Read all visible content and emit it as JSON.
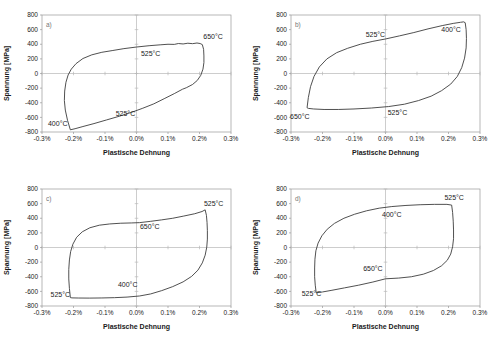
{
  "figure": {
    "background": "#ffffff",
    "frame_color": "#999999",
    "axis_color": "#b8b8b8",
    "curve_color": "#3c3c3c",
    "text_color": "#1a1a1a"
  },
  "chart_data": [
    {
      "type": "line",
      "panel_label": "a)",
      "xlabel": "Plastische Dehnung",
      "ylabel": "Spannung [MPa]",
      "xlim": [
        -0.3,
        0.3
      ],
      "ylim": [
        -800,
        800
      ],
      "x_tick_values": [
        -0.3,
        -0.2,
        -0.1,
        0.0,
        0.1,
        0.2,
        0.3
      ],
      "x_tick_labels": [
        "-0.3%",
        "-0.2%",
        "-0.1%",
        "0.0%",
        "0.1%",
        "0.2%",
        "0.3%"
      ],
      "y_tick_values": [
        800,
        600,
        400,
        200,
        0,
        -200,
        -400,
        -600,
        -800
      ],
      "y_tick_labels": [
        "800",
        "600",
        "400",
        "200",
        "0",
        "-200",
        "-400",
        "-600",
        "-800"
      ],
      "grid": false,
      "legend": "none",
      "annotations": [
        {
          "text": "650°C",
          "x": 0.243,
          "y": 500
        },
        {
          "text": "525°C",
          "x": 0.045,
          "y": 270
        },
        {
          "text": "525°C",
          "x": -0.035,
          "y": -545
        },
        {
          "text": "400°C",
          "x": -0.25,
          "y": -680
        }
      ],
      "series": [
        {
          "name": "Hystereseschleife",
          "points": [
            [
              -0.21,
              -770
            ],
            [
              -0.219,
              -640
            ],
            [
              -0.226,
              -500
            ],
            [
              -0.229,
              -370
            ],
            [
              -0.228,
              -240
            ],
            [
              -0.224,
              -120
            ],
            [
              -0.217,
              -20
            ],
            [
              -0.207,
              60
            ],
            [
              -0.192,
              135
            ],
            [
              -0.17,
              205
            ],
            [
              -0.142,
              255
            ],
            [
              -0.11,
              290
            ],
            [
              -0.075,
              315
            ],
            [
              -0.04,
              340
            ],
            [
              0.0,
              362
            ],
            [
              0.04,
              380
            ],
            [
              0.075,
              392
            ],
            [
              0.1,
              400
            ],
            [
              0.12,
              398
            ],
            [
              0.133,
              410
            ],
            [
              0.148,
              404
            ],
            [
              0.163,
              414
            ],
            [
              0.178,
              408
            ],
            [
              0.192,
              417
            ],
            [
              0.202,
              410
            ],
            [
              0.209,
              395
            ],
            [
              0.213,
              330
            ],
            [
              0.214,
              240
            ],
            [
              0.214,
              150
            ],
            [
              0.211,
              60
            ],
            [
              0.204,
              -25
            ],
            [
              0.193,
              -95
            ],
            [
              0.178,
              -150
            ],
            [
              0.158,
              -195
            ],
            [
              0.146,
              -215
            ],
            [
              0.12,
              -275
            ],
            [
              0.09,
              -340
            ],
            [
              0.055,
              -415
            ],
            [
              0.02,
              -475
            ],
            [
              -0.015,
              -530
            ],
            [
              -0.055,
              -585
            ],
            [
              -0.095,
              -635
            ],
            [
              -0.135,
              -685
            ],
            [
              -0.17,
              -725
            ],
            [
              -0.195,
              -755
            ]
          ]
        }
      ]
    },
    {
      "type": "line",
      "panel_label": "b)",
      "xlabel": "Plastische Dehnung",
      "ylabel": "Spannung [MPa]",
      "xlim": [
        -0.3,
        0.3
      ],
      "ylim": [
        -800,
        800
      ],
      "x_tick_values": [
        -0.3,
        -0.2,
        -0.1,
        0.0,
        0.1,
        0.2,
        0.3
      ],
      "x_tick_labels": [
        "-0.3%",
        "-0.2%",
        "-0.1%",
        "0.0%",
        "0.1%",
        "0.2%",
        "0.3%"
      ],
      "y_tick_values": [
        800,
        600,
        400,
        200,
        0,
        -200,
        -400,
        -600,
        -800
      ],
      "y_tick_labels": [
        "800",
        "600",
        "400",
        "200",
        "0",
        "-200",
        "-400",
        "-600",
        "-800"
      ],
      "grid": false,
      "legend": "none",
      "annotations": [
        {
          "text": "525°C",
          "x": -0.032,
          "y": 530
        },
        {
          "text": "400°C",
          "x": 0.208,
          "y": 600
        },
        {
          "text": "650°C",
          "x": -0.272,
          "y": -590
        },
        {
          "text": "525°C",
          "x": 0.038,
          "y": -530
        }
      ],
      "series": [
        {
          "name": "Hystereseschleife",
          "points": [
            [
              -0.249,
              -468
            ],
            [
              -0.245,
              -330
            ],
            [
              -0.238,
              -180
            ],
            [
              -0.227,
              -40
            ],
            [
              -0.21,
              90
            ],
            [
              -0.186,
              200
            ],
            [
              -0.155,
              285
            ],
            [
              -0.12,
              345
            ],
            [
              -0.08,
              400
            ],
            [
              -0.04,
              440
            ],
            [
              0.0,
              472
            ],
            [
              0.045,
              515
            ],
            [
              0.09,
              560
            ],
            [
              0.135,
              610
            ],
            [
              0.18,
              655
            ],
            [
              0.215,
              685
            ],
            [
              0.238,
              700
            ],
            [
              0.248,
              706
            ],
            [
              0.253,
              695
            ],
            [
              0.256,
              600
            ],
            [
              0.257,
              480
            ],
            [
              0.256,
              350
            ],
            [
              0.251,
              210
            ],
            [
              0.242,
              80
            ],
            [
              0.228,
              -40
            ],
            [
              0.207,
              -145
            ],
            [
              0.178,
              -235
            ],
            [
              0.145,
              -310
            ],
            [
              0.105,
              -370
            ],
            [
              0.06,
              -420
            ],
            [
              0.01,
              -452
            ],
            [
              -0.045,
              -472
            ],
            [
              -0.1,
              -485
            ],
            [
              -0.15,
              -492
            ],
            [
              -0.195,
              -492
            ],
            [
              -0.228,
              -485
            ],
            [
              -0.245,
              -477
            ]
          ]
        }
      ]
    },
    {
      "type": "line",
      "panel_label": "c)",
      "xlabel": "Plastische Dehnung",
      "ylabel": "Spannung [MPa]",
      "xlim": [
        -0.3,
        0.3
      ],
      "ylim": [
        -800,
        800
      ],
      "x_tick_values": [
        -0.3,
        -0.2,
        -0.1,
        0.0,
        0.1,
        0.2,
        0.3
      ],
      "x_tick_labels": [
        "-0.3%",
        "-0.2%",
        "-0.1%",
        "0.0%",
        "0.1%",
        "0.2%",
        "0.3%"
      ],
      "y_tick_values": [
        800,
        600,
        400,
        200,
        0,
        -200,
        -400,
        -600,
        -800
      ],
      "y_tick_labels": [
        "800",
        "600",
        "400",
        "200",
        "0",
        "-200",
        "-400",
        "-600",
        "-800"
      ],
      "grid": false,
      "legend": "none",
      "annotations": [
        {
          "text": "525°C",
          "x": 0.245,
          "y": 600
        },
        {
          "text": "650°C",
          "x": 0.042,
          "y": 290
        },
        {
          "text": "400°C",
          "x": -0.028,
          "y": -510
        },
        {
          "text": "525°C",
          "x": -0.242,
          "y": -648
        }
      ],
      "series": [
        {
          "name": "Hystereseschleife",
          "points": [
            [
              -0.21,
              -685
            ],
            [
              -0.213,
              -560
            ],
            [
              -0.215,
              -430
            ],
            [
              -0.215,
              -300
            ],
            [
              -0.213,
              -170
            ],
            [
              -0.209,
              -55
            ],
            [
              -0.202,
              45
            ],
            [
              -0.19,
              140
            ],
            [
              -0.172,
              215
            ],
            [
              -0.148,
              270
            ],
            [
              -0.118,
              305
            ],
            [
              -0.085,
              322
            ],
            [
              -0.05,
              332
            ],
            [
              -0.015,
              336
            ],
            [
              0.01,
              340
            ],
            [
              0.045,
              358
            ],
            [
              0.08,
              378
            ],
            [
              0.115,
              400
            ],
            [
              0.15,
              430
            ],
            [
              0.185,
              462
            ],
            [
              0.208,
              492
            ],
            [
              0.218,
              515
            ],
            [
              0.222,
              440
            ],
            [
              0.224,
              340
            ],
            [
              0.225,
              230
            ],
            [
              0.225,
              115
            ],
            [
              0.223,
              5
            ],
            [
              0.218,
              -105
            ],
            [
              0.209,
              -210
            ],
            [
              0.195,
              -310
            ],
            [
              0.175,
              -395
            ],
            [
              0.148,
              -470
            ],
            [
              0.115,
              -535
            ],
            [
              0.08,
              -590
            ],
            [
              0.045,
              -635
            ],
            [
              0.01,
              -663
            ],
            [
              -0.03,
              -678
            ],
            [
              -0.07,
              -686
            ],
            [
              -0.11,
              -690
            ],
            [
              -0.15,
              -692
            ],
            [
              -0.185,
              -691
            ],
            [
              -0.205,
              -689
            ]
          ]
        }
      ]
    },
    {
      "type": "line",
      "panel_label": "d)",
      "xlabel": "Plastische Dehnung",
      "ylabel": "Spannung [MPa]",
      "xlim": [
        -0.3,
        0.3
      ],
      "ylim": [
        -800,
        800
      ],
      "x_tick_values": [
        -0.3,
        -0.2,
        -0.1,
        0.0,
        0.1,
        0.2,
        0.3
      ],
      "x_tick_labels": [
        "-0.3%",
        "-0.2%",
        "-0.1%",
        "0.0%",
        "0.1%",
        "0.2%",
        "0.3%"
      ],
      "y_tick_values": [
        800,
        600,
        400,
        200,
        0,
        -200,
        -400,
        -600,
        -800
      ],
      "y_tick_labels": [
        "800",
        "600",
        "400",
        "200",
        "0",
        "-200",
        "-400",
        "-600",
        "-800"
      ],
      "grid": false,
      "legend": "none",
      "annotations": [
        {
          "text": "525°C",
          "x": 0.218,
          "y": 680
        },
        {
          "text": "400°C",
          "x": 0.02,
          "y": 455
        },
        {
          "text": "650°C",
          "x": -0.04,
          "y": -290
        },
        {
          "text": "525°C",
          "x": -0.235,
          "y": -625
        }
      ],
      "series": [
        {
          "name": "Hystereseschleife",
          "points": [
            [
              -0.22,
              -620
            ],
            [
              -0.223,
              -515
            ],
            [
              -0.225,
              -400
            ],
            [
              -0.225,
              -280
            ],
            [
              -0.224,
              -160
            ],
            [
              -0.221,
              -45
            ],
            [
              -0.214,
              60
            ],
            [
              -0.202,
              160
            ],
            [
              -0.185,
              250
            ],
            [
              -0.162,
              330
            ],
            [
              -0.132,
              400
            ],
            [
              -0.098,
              455
            ],
            [
              -0.06,
              502
            ],
            [
              -0.02,
              538
            ],
            [
              0.02,
              560
            ],
            [
              0.065,
              575
            ],
            [
              0.11,
              585
            ],
            [
              0.155,
              590
            ],
            [
              0.195,
              590
            ],
            [
              0.21,
              580
            ],
            [
              0.213,
              480
            ],
            [
              0.215,
              360
            ],
            [
              0.216,
              240
            ],
            [
              0.216,
              120
            ],
            [
              0.213,
              10
            ],
            [
              0.207,
              -90
            ],
            [
              0.196,
              -175
            ],
            [
              0.178,
              -250
            ],
            [
              0.152,
              -315
            ],
            [
              0.12,
              -365
            ],
            [
              0.082,
              -400
            ],
            [
              0.042,
              -418
            ],
            [
              0.0,
              -428
            ],
            [
              -0.04,
              -472
            ],
            [
              -0.085,
              -515
            ],
            [
              -0.13,
              -552
            ],
            [
              -0.17,
              -585
            ],
            [
              -0.2,
              -608
            ]
          ]
        }
      ]
    }
  ]
}
